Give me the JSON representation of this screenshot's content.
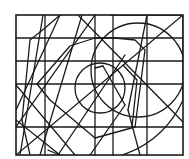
{
  "figure": {
    "stroke_color": "#1a1a1a",
    "background": "#ffffff",
    "border": {
      "x": 16,
      "y": 15,
      "w": 167,
      "h": 140
    },
    "vertical_lines": [
      45,
      95,
      113,
      147
    ],
    "horizontal_lines": [
      38,
      61,
      84,
      127
    ],
    "segments": [
      {
        "x1": 16,
        "y1": 155,
        "x2": 183,
        "y2": 15
      },
      {
        "x1": 16,
        "y1": 110,
        "x2": 60,
        "y2": 15
      },
      {
        "x1": 20,
        "y1": 155,
        "x2": 43,
        "y2": 15
      },
      {
        "x1": 16,
        "y1": 127,
        "x2": 95,
        "y2": 15
      },
      {
        "x1": 40,
        "y1": 155,
        "x2": 82,
        "y2": 15
      },
      {
        "x1": 78,
        "y1": 15,
        "x2": 183,
        "y2": 122
      },
      {
        "x1": 16,
        "y1": 85,
        "x2": 75,
        "y2": 155
      },
      {
        "x1": 16,
        "y1": 120,
        "x2": 60,
        "y2": 155
      },
      {
        "x1": 58,
        "y1": 155,
        "x2": 125,
        "y2": 55
      },
      {
        "x1": 90,
        "y1": 155,
        "x2": 125,
        "y2": 105
      },
      {
        "x1": 125,
        "y1": 105,
        "x2": 103,
        "y2": 66
      },
      {
        "x1": 103,
        "y1": 66,
        "x2": 95,
        "y2": 68
      },
      {
        "x1": 140,
        "y1": 155,
        "x2": 128,
        "y2": 110
      },
      {
        "x1": 128,
        "y1": 110,
        "x2": 147,
        "y2": 15
      }
    ],
    "polylines": [
      {
        "points": "30,155 22,120 30,40 45,28 60,15"
      },
      {
        "points": "37,84 50,100 95,138 135,127 145,50 135,40 115,38 95,38 70,46 37,84"
      },
      {
        "points": "132,127 137,80 123,65"
      }
    ],
    "circles": [
      {
        "cx": 138,
        "cy": 70,
        "r": 47
      },
      {
        "cx": 100,
        "cy": 88,
        "r": 25
      }
    ],
    "arcs": [
      {
        "d": "M 110 15 L 183 15 L 183 100 A 100 100 0 0 1 48 150"
      }
    ]
  }
}
